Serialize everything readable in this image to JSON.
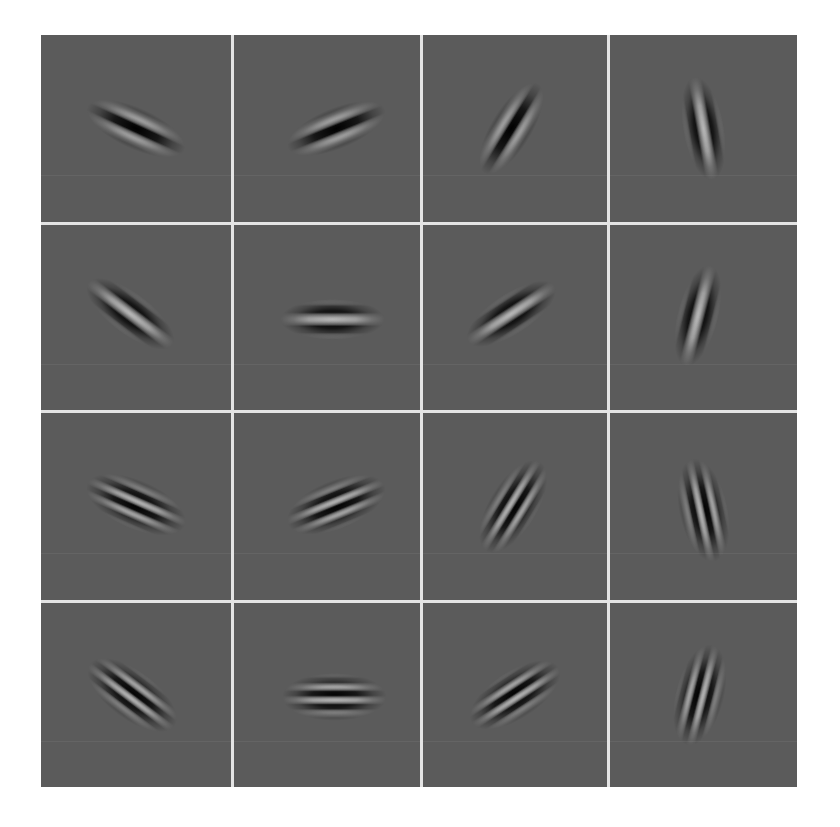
{
  "figure": {
    "title": "",
    "layout": {
      "rows": 4,
      "cols": 4
    },
    "background_color": "#5b5b5b",
    "separator_color": "#e4e4e4"
  },
  "cells": [
    {
      "row": 1,
      "col": 1,
      "angle": 25,
      "freq": "low",
      "phase": "dark-top",
      "cx": 50,
      "cy": 50,
      "stripes": 4
    },
    {
      "row": 1,
      "col": 2,
      "angle": -22,
      "freq": "low",
      "phase": "dark-top",
      "cx": 55,
      "cy": 50,
      "stripes": 4
    },
    {
      "row": 1,
      "col": 3,
      "angle": -58,
      "freq": "low",
      "phase": "dark-top",
      "cx": 48,
      "cy": 50,
      "stripes": 4
    },
    {
      "row": 1,
      "col": 4,
      "angle": 80,
      "freq": "low",
      "phase": "bright-top",
      "cx": 50,
      "cy": 50,
      "stripes": 4
    },
    {
      "row": 2,
      "col": 1,
      "angle": 38,
      "freq": "low",
      "phase": "bright-top",
      "cx": 47,
      "cy": 48,
      "stripes": 4
    },
    {
      "row": 2,
      "col": 2,
      "angle": 0,
      "freq": "low",
      "phase": "bright-top",
      "cx": 53,
      "cy": 51,
      "stripes": 4
    },
    {
      "row": 2,
      "col": 3,
      "angle": -33,
      "freq": "low",
      "phase": "bright-top",
      "cx": 48,
      "cy": 48,
      "stripes": 4
    },
    {
      "row": 2,
      "col": 4,
      "angle": -76,
      "freq": "low",
      "phase": "bright-top",
      "cx": 47,
      "cy": 49,
      "stripes": 4
    },
    {
      "row": 3,
      "col": 1,
      "angle": 24,
      "freq": "high",
      "phase": "dark-top",
      "cx": 50,
      "cy": 49,
      "stripes": 7
    },
    {
      "row": 3,
      "col": 2,
      "angle": -22,
      "freq": "high",
      "phase": "dark-top",
      "cx": 55,
      "cy": 49,
      "stripes": 7
    },
    {
      "row": 3,
      "col": 3,
      "angle": -58,
      "freq": "high",
      "phase": "dark-top",
      "cx": 49,
      "cy": 50,
      "stripes": 7
    },
    {
      "row": 3,
      "col": 4,
      "angle": 78,
      "freq": "high",
      "phase": "bright-top",
      "cx": 50,
      "cy": 52,
      "stripes": 7
    },
    {
      "row": 4,
      "col": 1,
      "angle": 38,
      "freq": "high",
      "phase": "bright-top",
      "cx": 48,
      "cy": 50,
      "stripes": 7
    },
    {
      "row": 4,
      "col": 2,
      "angle": 0,
      "freq": "high",
      "phase": "bright-top",
      "cx": 54,
      "cy": 51,
      "stripes": 7
    },
    {
      "row": 4,
      "col": 3,
      "angle": -33,
      "freq": "high",
      "phase": "bright-top",
      "cx": 50,
      "cy": 50,
      "stripes": 7
    },
    {
      "row": 4,
      "col": 4,
      "angle": -76,
      "freq": "high",
      "phase": "bright-top",
      "cx": 48,
      "cy": 50,
      "stripes": 7
    }
  ]
}
